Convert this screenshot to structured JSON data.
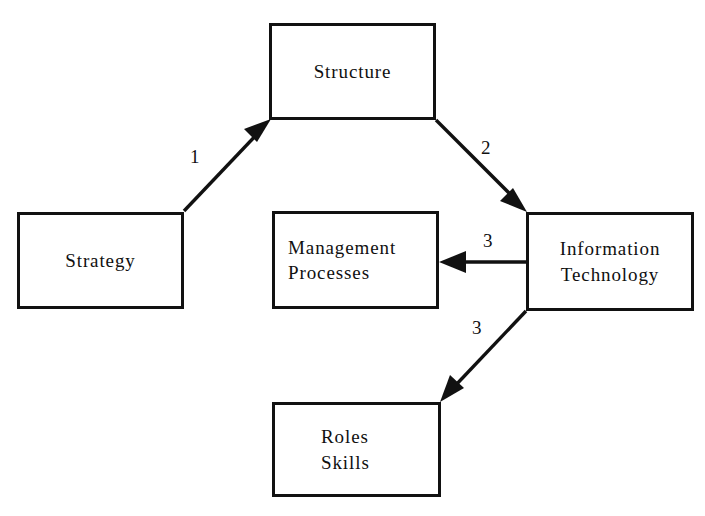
{
  "diagram": {
    "type": "flow-diagram",
    "background_color": "#ffffff",
    "line_color": "#111111",
    "text_color": "#101010",
    "nodes": [
      {
        "id": "strategy",
        "label": "Strategy",
        "lines": [
          "Strategy"
        ]
      },
      {
        "id": "structure",
        "label": "Structure",
        "lines": [
          "Structure"
        ]
      },
      {
        "id": "management",
        "label": "Management Processes",
        "lines": [
          "Management",
          "Processes"
        ]
      },
      {
        "id": "information",
        "label": "Information Technology",
        "lines": [
          "Information",
          "Technology"
        ]
      },
      {
        "id": "roles",
        "label": "Roles Skills",
        "lines": [
          "Roles",
          "Skills"
        ]
      }
    ],
    "edges": [
      {
        "id": "edge-1",
        "label": "1",
        "from": "strategy",
        "to": "structure"
      },
      {
        "id": "edge-2",
        "label": "2",
        "from": "structure",
        "to": "information"
      },
      {
        "id": "edge-3a",
        "label": "3",
        "from": "information",
        "to": "management"
      },
      {
        "id": "edge-3b",
        "label": "3",
        "from": "information",
        "to": "roles"
      }
    ]
  }
}
